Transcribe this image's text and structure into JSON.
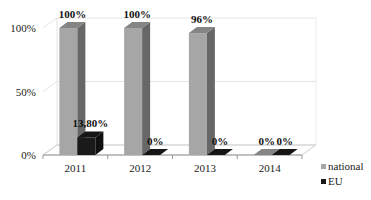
{
  "chart_data": {
    "type": "bar",
    "subtype": "3d-clustered-column",
    "title": "",
    "xlabel": "",
    "ylabel": "",
    "categories": [
      "2011",
      "2012",
      "2013",
      "2014"
    ],
    "series": [
      {
        "name": "national",
        "values": [
          100,
          100,
          96,
          0
        ],
        "labels": [
          "100%",
          "100%",
          "96%",
          "0%"
        ],
        "color": "#a6a6a6"
      },
      {
        "name": "EU",
        "values": [
          13.8,
          0,
          0,
          0
        ],
        "labels": [
          "13,80%",
          "0%",
          "0%",
          "0%"
        ],
        "color": "#1a1a1a"
      }
    ],
    "ylim": [
      0,
      100
    ],
    "yticks": [
      "0%",
      "50%",
      "100%"
    ],
    "grid": true,
    "legend_position": "right-bottom"
  },
  "legend": {
    "items": [
      {
        "label": "national",
        "color": "#a6a6a6"
      },
      {
        "label": "EU",
        "color": "#1a1a1a"
      }
    ]
  }
}
